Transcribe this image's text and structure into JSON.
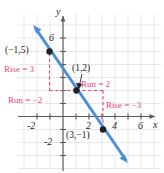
{
  "figure": {
    "type": "coordinate-graph"
  },
  "axes": {
    "x_label": "x",
    "y_label": "y",
    "x_ticks": [
      "-2",
      "2",
      "4",
      "6"
    ],
    "y_ticks": [
      "6",
      "-2"
    ],
    "grid": true,
    "x_range": [
      -3.1,
      7.3
    ],
    "y_range": [
      -3.8,
      7.6
    ],
    "origin_px": [
      63,
      116.5
    ],
    "unit_px": 13.0
  },
  "line": {
    "color": "#4a90d9",
    "slope": -1.5,
    "intercept": 3.5,
    "from_px": [
      33,
      25
    ],
    "to_px": [
      128,
      163
    ],
    "arrow_both_ends": true
  },
  "points": [
    {
      "label": "(-1,5)",
      "display": "(−1,5)",
      "x": -1,
      "y": 5,
      "px": [
        49.5,
        51.5
      ]
    },
    {
      "label": "(1,2)",
      "display": "(1,2)",
      "x": 1,
      "y": 2,
      "px": [
        76.5,
        90.5
      ]
    },
    {
      "label": "(3,-1)",
      "display": "(3,−1)",
      "x": 3,
      "y": -1,
      "px": [
        103,
        129.5
      ]
    }
  ],
  "annotations": {
    "color": "#e8407a",
    "rise_positive": "Rise = 3",
    "run_negative": "Run = −2",
    "run_positive": "Run = 2",
    "rise_negative": "Rise = −3"
  },
  "point_labels": {
    "upper_left": "(−1,5)",
    "middle": "(1,2)",
    "lower": "(3,−1)"
  }
}
